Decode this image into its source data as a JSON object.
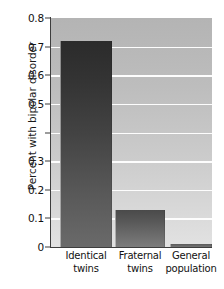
{
  "chart_data": {
    "type": "bar",
    "title": "",
    "subtitle": "",
    "xlabel": "",
    "ylabel": "Percent with bipolar disorder",
    "categories": [
      "Identical twins",
      "Fraternal twins",
      "General population"
    ],
    "category_lines": [
      {
        "line1": "Identical",
        "line2": "twins"
      },
      {
        "line1": "Fraternal",
        "line2": "twins"
      },
      {
        "line1": "General",
        "line2": "population"
      }
    ],
    "values": [
      0.72,
      0.13,
      0.01
    ],
    "ylim": [
      0,
      0.8
    ],
    "ytick_values": [
      0.8,
      0.7,
      0.6,
      0.5,
      0.4,
      0.3,
      0.2,
      0.1,
      0
    ],
    "ytick_labels": [
      "0.8",
      "0.7",
      "0.6",
      "0.5",
      "",
      "0.3",
      "0.2",
      "0.1",
      "0"
    ],
    "grid": "horizontal",
    "legend": "none",
    "plot_background_color": "#c8c8c8",
    "gridline_color": "#fdfdfd",
    "bar_colors": [
      "#3a3a3a",
      "#5f5f5f",
      "#6a6a6a"
    ],
    "axis_color": "#3d3d3d",
    "text_color": "#111111"
  }
}
